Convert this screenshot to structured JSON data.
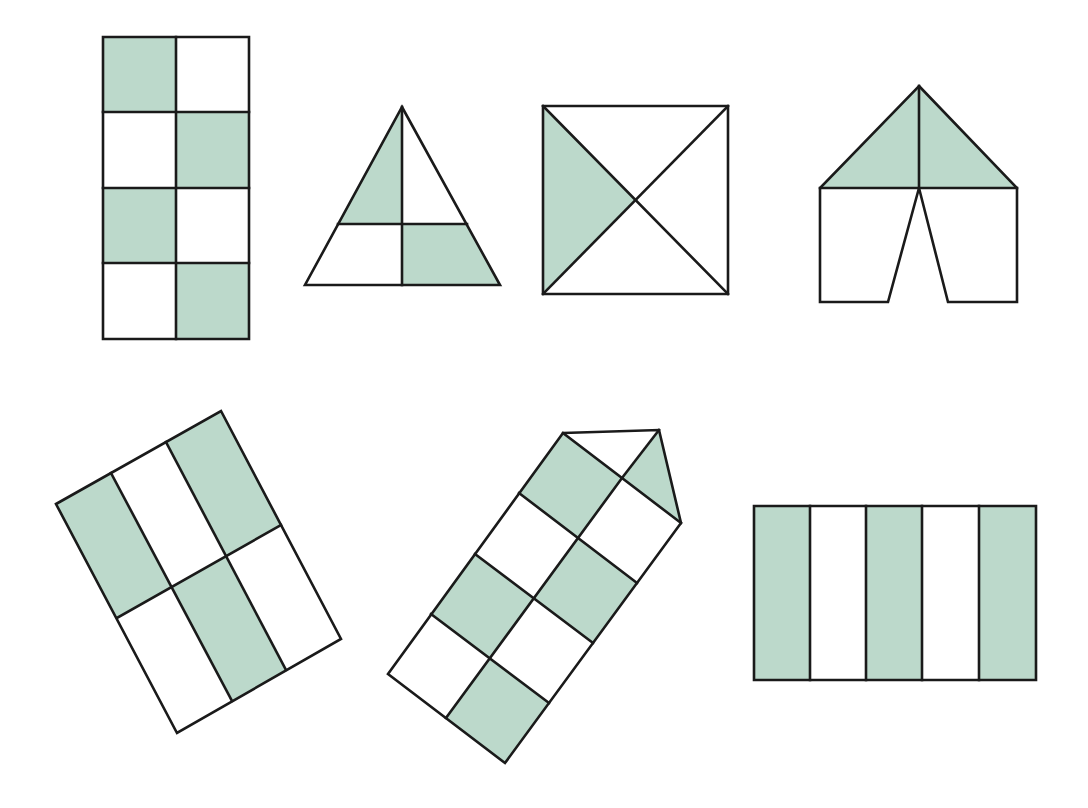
{
  "colors": {
    "shade": "#bcd9cb",
    "unshaded": "#ffffff",
    "stroke": "#1a1a1a",
    "background": "#ffffff"
  },
  "figures": [
    {
      "id": "checkered-rectangle",
      "description": "2x4 rectangle grid, alternating shading",
      "shaded_parts": 4,
      "total_parts": 8,
      "shaded": [
        [
          [
            103,
            37
          ],
          [
            176,
            37
          ],
          [
            176,
            112
          ],
          [
            103,
            112
          ]
        ],
        [
          [
            176,
            112
          ],
          [
            249,
            112
          ],
          [
            249,
            188
          ],
          [
            176,
            188
          ]
        ],
        [
          [
            103,
            188
          ],
          [
            176,
            188
          ],
          [
            176,
            263
          ],
          [
            103,
            263
          ]
        ],
        [
          [
            176,
            263
          ],
          [
            249,
            263
          ],
          [
            249,
            339
          ],
          [
            176,
            339
          ]
        ]
      ],
      "outline": [
        [
          103,
          37
        ],
        [
          249,
          37
        ],
        [
          249,
          339
        ],
        [
          103,
          339
        ]
      ],
      "lines": [
        [
          [
            176,
            37
          ],
          [
            176,
            339
          ]
        ],
        [
          [
            103,
            112
          ],
          [
            249,
            112
          ]
        ],
        [
          [
            103,
            188
          ],
          [
            249,
            188
          ]
        ],
        [
          [
            103,
            263
          ],
          [
            249,
            263
          ]
        ]
      ]
    },
    {
      "id": "divided-triangle",
      "description": "Triangle split by vertical median and horizontal line into 4 parts, 2 shaded",
      "shaded_parts": 2,
      "total_parts": 4,
      "shaded": [
        [
          [
            402,
            107
          ],
          [
            402,
            224
          ],
          [
            338,
            224
          ]
        ],
        [
          [
            402,
            224
          ],
          [
            467,
            224
          ],
          [
            500,
            285
          ],
          [
            402,
            285
          ]
        ]
      ],
      "outline": [
        [
          402,
          107
        ],
        [
          500,
          285
        ],
        [
          305,
          285
        ]
      ],
      "lines": [
        [
          [
            402,
            107
          ],
          [
            402,
            285
          ]
        ],
        [
          [
            338,
            224
          ],
          [
            467,
            224
          ]
        ]
      ]
    },
    {
      "id": "square-diagonals",
      "description": "Square divided by both diagonals, left quarter shaded",
      "shaded_parts": 1,
      "total_parts": 4,
      "shaded": [
        [
          [
            543,
            106
          ],
          [
            636,
            200
          ],
          [
            543,
            294
          ]
        ]
      ],
      "outline": [
        [
          543,
          106
        ],
        [
          728,
          106
        ],
        [
          728,
          294
        ],
        [
          543,
          294
        ]
      ],
      "lines": [
        [
          [
            543,
            106
          ],
          [
            728,
            294
          ]
        ],
        [
          [
            728,
            106
          ],
          [
            543,
            294
          ]
        ]
      ]
    },
    {
      "id": "tent-shape",
      "description": "Tent: triangular roof split in half (both shaded) over open-notch base",
      "shaded_parts": 2,
      "total_parts": 4,
      "shaded": [
        [
          [
            919,
            86
          ],
          [
            1017,
            188
          ],
          [
            820,
            188
          ]
        ]
      ],
      "outline": [
        [
          919,
          86
        ],
        [
          1017,
          188
        ],
        [
          1017,
          302
        ],
        [
          948,
          302
        ],
        [
          919,
          188
        ],
        [
          888,
          302
        ],
        [
          820,
          302
        ],
        [
          820,
          188
        ]
      ],
      "lines": [
        [
          [
            919,
            86
          ],
          [
            919,
            188
          ]
        ],
        [
          [
            820,
            188
          ],
          [
            1017,
            188
          ]
        ]
      ]
    },
    {
      "id": "rotated-rectangle-grid",
      "description": "Tilted rectangle split into 3 columns x 2 rows, 3 shaded",
      "shaded_parts": 3,
      "total_parts": 6,
      "corners": {
        "tl": [
          56,
          504
        ],
        "tr": [
          221,
          411
        ],
        "br": [
          341,
          639
        ],
        "bl": [
          177,
          733
        ]
      },
      "shaded": [
        [
          [
            56,
            504
          ],
          [
            111,
            473
          ],
          [
            172,
            587
          ],
          [
            117,
            618
          ]
        ],
        [
          [
            166,
            442
          ],
          [
            221,
            411
          ],
          [
            281,
            525
          ],
          [
            226,
            556
          ]
        ],
        [
          [
            172,
            587
          ],
          [
            226,
            556
          ],
          [
            286,
            670
          ],
          [
            232,
            701
          ]
        ]
      ],
      "outline": [
        [
          56,
          504
        ],
        [
          221,
          411
        ],
        [
          341,
          639
        ],
        [
          177,
          733
        ]
      ],
      "lines": [
        [
          [
            111,
            473
          ],
          [
            232,
            701
          ]
        ],
        [
          [
            166,
            442
          ],
          [
            286,
            670
          ]
        ],
        [
          [
            117,
            618
          ],
          [
            281,
            525
          ]
        ]
      ]
    },
    {
      "id": "rotated-house-grid",
      "description": "Tilted 2x4 square grid with triangular roof split in two; 4 squares + 1 roof triangle shaded",
      "shaded_parts": 5,
      "total_parts": 10,
      "shaded": [
        [
          [
            563,
            433
          ],
          [
            622,
            478
          ],
          [
            578,
            538
          ],
          [
            519,
            493
          ]
        ],
        [
          [
            622,
            478
          ],
          [
            659,
            430
          ],
          [
            681,
            523
          ]
        ],
        [
          [
            637,
            583
          ],
          [
            593,
            643
          ],
          [
            534,
            598
          ],
          [
            578,
            538
          ]
        ],
        [
          [
            519,
            493
          ],
          [
            475,
            553
          ],
          [
            431,
            614
          ],
          [
            475,
            553
          ]
        ],
        [
          [
            475,
            554
          ],
          [
            534,
            598
          ],
          [
            490,
            658
          ],
          [
            431,
            614
          ]
        ],
        [
          [
            490,
            658
          ],
          [
            549,
            703
          ],
          [
            505,
            763
          ],
          [
            446,
            718
          ]
        ]
      ],
      "outline": [
        [
          563,
          433
        ],
        [
          659,
          430
        ],
        [
          681,
          523
        ],
        [
          505,
          763
        ],
        [
          388,
          674
        ]
      ],
      "lines": [
        [
          [
            563,
            433
          ],
          [
            681,
            523
          ]
        ],
        [
          [
            659,
            430
          ],
          [
            622,
            478
          ]
        ],
        [
          [
            622,
            478
          ],
          [
            446,
            718
          ]
        ],
        [
          [
            519,
            493
          ],
          [
            637,
            583
          ]
        ],
        [
          [
            475,
            554
          ],
          [
            593,
            643
          ]
        ],
        [
          [
            431,
            614
          ],
          [
            549,
            703
          ]
        ]
      ]
    },
    {
      "id": "striped-rectangle",
      "description": "Rectangle split into 5 vertical strips, strips 1, 3, 5 shaded",
      "shaded_parts": 3,
      "total_parts": 5,
      "shaded": [
        [
          [
            754,
            506
          ],
          [
            810,
            506
          ],
          [
            810,
            680
          ],
          [
            754,
            680
          ]
        ],
        [
          [
            866,
            506
          ],
          [
            922,
            506
          ],
          [
            922,
            680
          ],
          [
            866,
            680
          ]
        ],
        [
          [
            979,
            506
          ],
          [
            1036,
            506
          ],
          [
            1036,
            680
          ],
          [
            979,
            680
          ]
        ]
      ],
      "outline": [
        [
          754,
          506
        ],
        [
          1036,
          506
        ],
        [
          1036,
          680
        ],
        [
          754,
          680
        ]
      ],
      "lines": [
        [
          [
            810,
            506
          ],
          [
            810,
            680
          ]
        ],
        [
          [
            866,
            506
          ],
          [
            866,
            680
          ]
        ],
        [
          [
            922,
            506
          ],
          [
            922,
            680
          ]
        ],
        [
          [
            979,
            506
          ],
          [
            979,
            680
          ]
        ]
      ]
    }
  ]
}
